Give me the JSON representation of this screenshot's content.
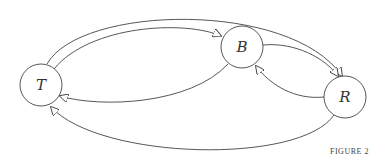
{
  "diagram": {
    "nodes": [
      {
        "id": "T",
        "label": "T",
        "cx": 41,
        "cy": 85,
        "r": 21
      },
      {
        "id": "B",
        "label": "B",
        "cx": 242,
        "cy": 47,
        "r": 21
      },
      {
        "id": "R",
        "label": "R",
        "cx": 345,
        "cy": 97,
        "r": 21
      }
    ],
    "edges": [
      {
        "from": "T",
        "to": "B"
      },
      {
        "from": "T",
        "to": "R"
      },
      {
        "from": "B",
        "to": "T"
      },
      {
        "from": "B",
        "to": "R"
      },
      {
        "from": "R",
        "to": "B"
      },
      {
        "from": "R",
        "to": "T"
      }
    ],
    "caption": "FIGURE 2",
    "colors": {
      "stroke": "#444444",
      "background": "#ffffff"
    }
  }
}
